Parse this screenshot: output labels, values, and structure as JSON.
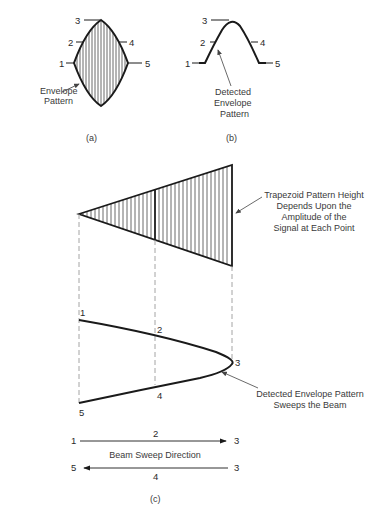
{
  "figure_a": {
    "caption": "(a)",
    "points": [
      "1",
      "2",
      "3",
      "4",
      "5"
    ],
    "annotation_line1": "Envelope",
    "annotation_line2": "Pattern"
  },
  "figure_b": {
    "caption": "(b)",
    "points": [
      "1",
      "2",
      "3",
      "4",
      "5"
    ],
    "annotation_line1": "Detected",
    "annotation_line2": "Envelope",
    "annotation_line3": "Pattern"
  },
  "figure_c": {
    "caption": "(c)",
    "trapezoid_annotation": [
      "Trapezoid Pattern Height",
      "Depends Upon the",
      "Amplitude of the",
      "Signal at Each Point"
    ],
    "envelope_points": [
      "1",
      "2",
      "3",
      "4",
      "5"
    ],
    "envelope_annotation": [
      "Detected Envelope Pattern",
      "Sweeps the Beam"
    ],
    "sweep": {
      "forward": {
        "start": "1",
        "mid": "2",
        "end": "3"
      },
      "label": "Beam Sweep Direction",
      "reverse": {
        "start": "3",
        "mid": "4",
        "end": "5"
      }
    }
  },
  "colors": {
    "line": "#1a1a1a",
    "hatch": "#444444",
    "dashed": "#9a9a9a",
    "text": "#2a2a2a"
  }
}
